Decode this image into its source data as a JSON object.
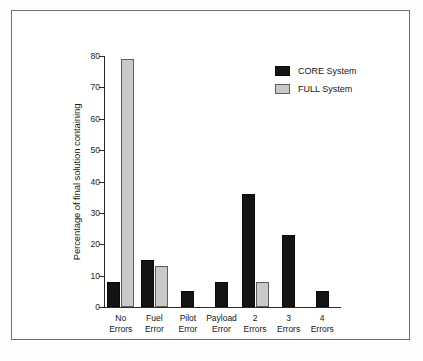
{
  "chart_data": {
    "type": "bar",
    "title": "",
    "subtitle": "",
    "xlabel": "",
    "ylabel": "Percentage of final solution containing",
    "ylim": [
      0,
      80
    ],
    "yticks": [
      0,
      10,
      20,
      30,
      40,
      50,
      60,
      70,
      80
    ],
    "ytick_labels": [
      "0",
      "10",
      "20",
      "30",
      "40",
      "50",
      "60",
      "70",
      "80"
    ],
    "grid": false,
    "legend_position": "top-right",
    "categories": [
      "No\nErrors",
      "Fuel\nError",
      "Pilot\nError",
      "Payload\nError",
      "2\nErrors",
      "3\nErrors",
      "4\nErrors"
    ],
    "category_labels_flat": [
      "No Errors",
      "Fuel Error",
      "Pilot Error",
      "Payload Error",
      "2 Errors",
      "3 Errors",
      "4 Errors"
    ],
    "series": [
      {
        "name": "CORE System",
        "color": "#141414",
        "values": [
          8,
          15,
          5,
          8,
          36,
          23,
          5
        ]
      },
      {
        "name": "FULL System",
        "color": "#c9c9c9",
        "values": [
          79,
          13,
          0,
          0,
          8,
          0,
          0
        ]
      }
    ]
  },
  "legend": {
    "items": [
      {
        "label": "CORE System",
        "swatch": "core"
      },
      {
        "label": "FULL System",
        "swatch": "full"
      }
    ]
  },
  "colors": {
    "core": "#141414",
    "full": "#c9c9c9",
    "axis": "#2b2b2b",
    "frame": "#6f6f70",
    "background": "#ffffff"
  }
}
